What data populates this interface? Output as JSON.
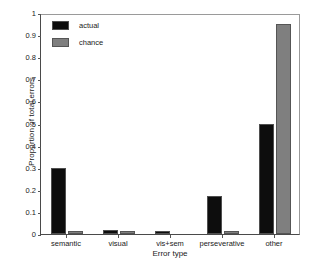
{
  "chart_data": {
    "type": "bar",
    "title": "",
    "xlabel": "Error type",
    "ylabel": "Proportion of total errors",
    "categories": [
      "semantic",
      "visual",
      "vis+sem",
      "perseverative",
      "other"
    ],
    "series": [
      {
        "name": "actual",
        "color": "#0d0d0d",
        "values": [
          0.3,
          0.02,
          0.01,
          0.17,
          0.5
        ]
      },
      {
        "name": "chance",
        "color": "#7f7f7f",
        "values": [
          0.015,
          0.013,
          0.0,
          0.015,
          0.95
        ]
      }
    ],
    "ylim": [
      0,
      1
    ],
    "yticks": [
      "0",
      "0.1",
      "0.2",
      "0.3",
      "0.4",
      "0.5",
      "0.6",
      "0.7",
      "0.8",
      "0.9",
      "1"
    ],
    "grid": false,
    "legend_position": "top-left"
  },
  "legend": {
    "items": [
      {
        "label": "actual"
      },
      {
        "label": "chance"
      }
    ]
  }
}
